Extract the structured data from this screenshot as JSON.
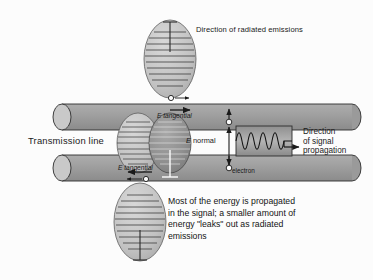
{
  "figure": {
    "title_alt": "Radiated emissions from a transmission line",
    "background_color": "#fcfcfc",
    "cylinder_color": "#9a9a9a",
    "cylinder_cap_color": "#c9c9c9",
    "lobe_light_color": "#c2c2c2",
    "lobe_dark_color": "#8f8f8f",
    "stroke_color": "#1a1a1a"
  },
  "labels": {
    "radiated_emissions": "Direction of radiated emissions",
    "transmission_line": "Transmission line",
    "e_tangential_top": "E tangential",
    "e_tangential_bottom": "E tangential",
    "e_normal_italic": "E",
    "e_normal_rest": " normal",
    "electron": "electron",
    "direction_signal_line1": "Direction",
    "direction_signal_line2": "of signal",
    "direction_signal_line3": "propagation"
  },
  "caption": {
    "line1": "Most of the energy is propagated",
    "line2": "in the signal; a smaller amount of",
    "line3": "energy \"leaks\" out as radiated",
    "line4": "emissions"
  },
  "diagram": {
    "transmission_lines": [
      {
        "name": "upper-transmission-line",
        "y": 104,
        "height": 26
      },
      {
        "name": "lower-transmission-line",
        "y": 155,
        "height": 26
      }
    ],
    "radiation_lobes": [
      {
        "name": "top-radiation-lobe",
        "cx": 170,
        "cy": 59,
        "rx": 26,
        "ry": 39,
        "shade": "light"
      },
      {
        "name": "middle-left-radiation-lobe",
        "cx": 138,
        "cy": 143,
        "rx": 21,
        "ry": 30,
        "shade": "light"
      },
      {
        "name": "middle-right-radiation-lobe",
        "cx": 170,
        "cy": 143,
        "rx": 21,
        "ry": 30,
        "shade": "dark"
      },
      {
        "name": "bottom-radiation-lobe",
        "cx": 140,
        "cy": 222,
        "rx": 26,
        "ry": 39,
        "shade": "light"
      }
    ],
    "signal_wave": {
      "name": "signal-sine-wave",
      "cycles": 3.5,
      "x": 236,
      "y": 126,
      "width": 56,
      "height": 30,
      "amplitude": 11
    },
    "electrons": [
      {
        "name": "electron-upper-line",
        "cx": 171,
        "cy": 98
      },
      {
        "name": "electron-lower-line",
        "cx": 146,
        "cy": 178
      },
      {
        "name": "electron-e-normal-top",
        "cx": 229,
        "cy": 122
      },
      {
        "name": "electron-e-normal-bottom",
        "cx": 229,
        "cy": 168
      }
    ],
    "e_normal_axis": {
      "x": 229,
      "top": 109,
      "bottom": 176
    },
    "propagation_arrow": {
      "from_x": 289,
      "to_x": 301,
      "y": 146
    }
  }
}
